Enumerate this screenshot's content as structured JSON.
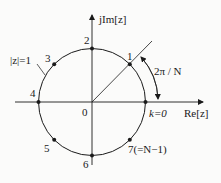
{
  "diagram": {
    "type": "z-plane unit circle with N=8 roots of unity",
    "axes": {
      "imag_label": "jIm[z]",
      "real_label": "Re[z]",
      "origin_label": "0"
    },
    "circle_label": "|z|=1",
    "angle_label": "2π / N",
    "points": [
      {
        "k": 0,
        "label": "k=0",
        "angle_deg": 0
      },
      {
        "k": 1,
        "label": "1",
        "angle_deg": 45
      },
      {
        "k": 2,
        "label": "2",
        "angle_deg": 90
      },
      {
        "k": 3,
        "label": "3",
        "angle_deg": 135
      },
      {
        "k": 4,
        "label": "4",
        "angle_deg": 180
      },
      {
        "k": 5,
        "label": "5",
        "angle_deg": 225
      },
      {
        "k": 6,
        "label": "6",
        "angle_deg": 270
      },
      {
        "k": 7,
        "label": "7(=N−1)",
        "angle_deg": 315
      }
    ],
    "colors": {
      "ink": "#1a1a1a",
      "background": "#fbfbfa"
    }
  }
}
